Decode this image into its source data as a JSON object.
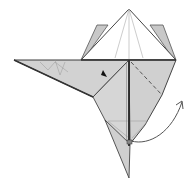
{
  "diagram": {
    "type": "origami-fold-step",
    "colors": {
      "background": "#ffffff",
      "paper_colored": "#d4d4d4",
      "paper_colored_dark": "#c4c4c4",
      "paper_white": "#ffffff",
      "edge": "#3a3a3a",
      "crease": "#8a8a8a",
      "arrow": "#555555"
    },
    "symbols": {
      "valley_fold_line": "dashed diagonal line on right side",
      "push_marker": "small black arrowhead",
      "fold_arrow": "curved arrow at bottom right"
    }
  }
}
